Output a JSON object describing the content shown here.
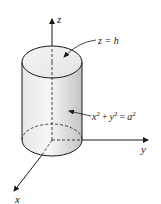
{
  "diagram": {
    "type": "3d-cylinder-coordinate-figure",
    "axes": {
      "z": {
        "label": "z"
      },
      "y": {
        "label": "y"
      },
      "x": {
        "label": "x"
      }
    },
    "annotations": {
      "top": {
        "text": "z = h"
      },
      "side": {
        "x": "x",
        "y": "y",
        "a": "a",
        "exp": "2",
        "plus": "+",
        "eq": "="
      }
    },
    "colors": {
      "stroke": "#1a1a1a",
      "fill_light": "#f2f2f2",
      "fill_dark": "#c8c8c8"
    }
  }
}
